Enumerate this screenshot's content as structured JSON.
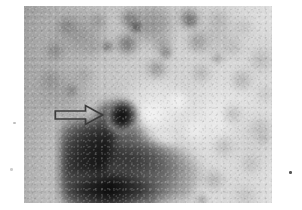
{
  "figure": {
    "type": "medical-scan",
    "modality": "scintigraphy",
    "orientation": "planar",
    "colormap": "grayscale",
    "alt_text": "Grayscale planar scintigraphic image with mottled tracer distribution; a large intense uptake region occupies the lower left and an open arrow indicates a small focal uptake spot just above it."
  },
  "annotations": {
    "arrow": {
      "name": "pointer-arrow",
      "style": "open-outline",
      "direction": "right",
      "stroke_color": "#3b3b3b",
      "fill_color": "transparent",
      "points_to": "focal-uptake-spot"
    },
    "focal_spot": {
      "name": "focal-uptake-spot",
      "description": "small round intense focus",
      "intensity": "high"
    },
    "dominant_mass": {
      "name": "dominant-uptake-region",
      "description": "large confluent intense uptake in the lower left field",
      "intensity": "very-high"
    }
  },
  "image_field": {
    "background_color": "#ffffff",
    "plate_base_color": "#c9c9c9",
    "dark_color": "#050505",
    "mid_color": "#9a9a9a",
    "light_color": "#f2f2f2"
  },
  "artifacts": {
    "specks": [
      {
        "name": "dust-speck-left-upper"
      },
      {
        "name": "dust-speck-left-lower"
      },
      {
        "name": "dust-speck-right-edge"
      }
    ]
  }
}
